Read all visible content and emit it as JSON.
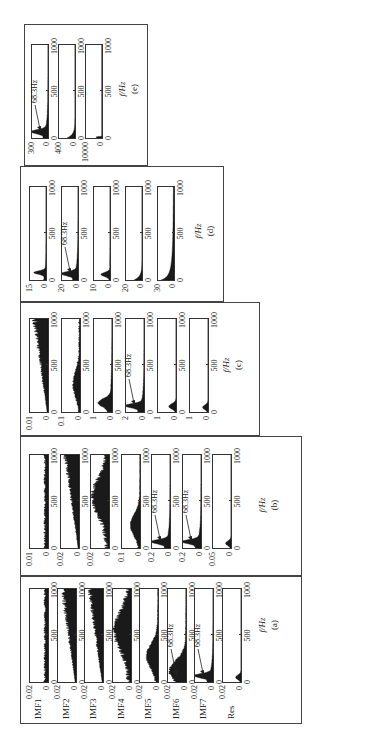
{
  "figure": {
    "orientation": "rotated 90 degrees counter-clockwise on page",
    "x_axis_label": "f/Hz",
    "x_ticks": [
      "0",
      "500",
      "1000"
    ],
    "annotation_text": "68.3Hz"
  },
  "chart_data": [
    {
      "type": "area",
      "panel": "(a)",
      "xlabel": "f/Hz",
      "xlim": [
        0,
        1000
      ],
      "x_ticks": [
        0,
        500,
        1000
      ],
      "subplots": [
        {
          "name": "IMF1",
          "ylim": [
            0,
            0.02
          ],
          "y_ticks": [
            "0",
            "0.02"
          ],
          "shape": "flat broadband noise across 0-1000 Hz"
        },
        {
          "name": "IMF2",
          "ylim": [
            0,
            0.02
          ],
          "y_ticks": [
            "0",
            "0.02"
          ],
          "shape": "low broadband noise rising toward 1000 Hz"
        },
        {
          "name": "IMF3",
          "ylim": [
            0,
            0.02
          ],
          "y_ticks": [
            "0",
            "0.02"
          ],
          "shape": "broadband, increasing toward 1000 Hz"
        },
        {
          "name": "IMF4",
          "ylim": [
            0,
            0.02
          ],
          "y_ticks": [
            "0",
            "0.02"
          ],
          "shape": "broad hump centered ~500-600 Hz"
        },
        {
          "name": "IMF5",
          "ylim": [
            0,
            0.02
          ],
          "y_ticks": [
            "0",
            "0.02"
          ],
          "shape": "hump centered ~250-300 Hz"
        },
        {
          "name": "IMF6",
          "ylim": [
            0,
            0.02
          ],
          "y_ticks": [
            "0",
            "0.02"
          ],
          "shape": "energy below ~400 Hz, peak near 68.3 Hz",
          "annotation": "68.3Hz"
        },
        {
          "name": "IMF7",
          "ylim": [
            0,
            0.02
          ],
          "y_ticks": [
            "0",
            "0.02"
          ],
          "shape": "narrow low-frequency peak at 68.3 Hz",
          "annotation": "68.3Hz"
        },
        {
          "name": "Res",
          "ylim": [
            0,
            0.02
          ],
          "y_ticks": [
            "0",
            "0.02"
          ],
          "shape": "small peak below ~100 Hz"
        }
      ]
    },
    {
      "type": "area",
      "panel": "(b)",
      "xlabel": "f/Hz",
      "xlim": [
        0,
        1000
      ],
      "x_ticks": [
        0,
        500,
        1000
      ],
      "subplots": [
        {
          "ylim": [
            0,
            0.01
          ],
          "y_ticks": [
            "0",
            "0.01"
          ],
          "shape": "flat broadband noise"
        },
        {
          "ylim": [
            0,
            0.02
          ],
          "y_ticks": [
            "0",
            "0.02"
          ],
          "shape": "broadband, rising toward 1000 Hz"
        },
        {
          "ylim": [
            0,
            0.02
          ],
          "y_ticks": [
            "0",
            "0.02"
          ],
          "shape": "broad hump centered ~500 Hz"
        },
        {
          "ylim": [
            0,
            0.1
          ],
          "y_ticks": [
            "0",
            "0.1"
          ],
          "shape": "hump centered ~250 Hz"
        },
        {
          "ylim": [
            0,
            0.2
          ],
          "y_ticks": [
            "0",
            "0.2"
          ],
          "shape": "peak near 68.3 Hz",
          "annotation": "68.3Hz"
        },
        {
          "ylim": [
            0,
            0.2
          ],
          "y_ticks": [
            "0",
            "0.2"
          ],
          "shape": "peak near 68.3 Hz",
          "annotation": "68.3Hz"
        },
        {
          "ylim": [
            0,
            0.05
          ],
          "y_ticks": [
            "0",
            "0.05"
          ],
          "shape": "small peak below ~60 Hz"
        }
      ]
    },
    {
      "type": "area",
      "panel": "(c)",
      "xlabel": "f/Hz",
      "xlim": [
        0,
        1000
      ],
      "x_ticks": [
        0,
        500,
        1000
      ],
      "subplots": [
        {
          "ylim": [
            0,
            0.01
          ],
          "y_ticks": [
            "0",
            "0.01"
          ],
          "shape": "broadband rising toward 1000 Hz"
        },
        {
          "ylim": [
            0,
            0.1
          ],
          "y_ticks": [
            "0",
            "0.1"
          ],
          "shape": "broad hump ~250-400 Hz"
        },
        {
          "ylim": [
            0,
            1
          ],
          "y_ticks": [
            "0",
            "1"
          ],
          "shape": "peak near ~100 Hz decaying"
        },
        {
          "ylim": [
            0,
            2
          ],
          "y_ticks": [
            "0",
            "2"
          ],
          "shape": "peak at 68.3 Hz",
          "annotation": "68.3Hz"
        },
        {
          "ylim": [
            0,
            1
          ],
          "y_ticks": [
            "0",
            "1"
          ],
          "shape": "small low-frequency peak"
        },
        {
          "ylim": [
            0,
            1
          ],
          "y_ticks": [
            "0",
            "1"
          ],
          "shape": "very small low-frequency peak"
        }
      ]
    },
    {
      "type": "area",
      "panel": "(d)",
      "xlabel": "f/Hz",
      "xlim": [
        0,
        1000
      ],
      "x_ticks": [
        0,
        500,
        1000
      ],
      "subplots": [
        {
          "ylim": [
            0,
            15
          ],
          "y_ticks": [
            "0",
            "15"
          ],
          "shape": "sharp peak ~80 Hz"
        },
        {
          "ylim": [
            0,
            20
          ],
          "y_ticks": [
            "0",
            "20"
          ],
          "shape": "sharp peak at 68.3 Hz",
          "annotation": "68.3Hz"
        },
        {
          "ylim": [
            0,
            10
          ],
          "y_ticks": [
            "0",
            "10"
          ],
          "shape": "peak ~60 Hz"
        },
        {
          "ylim": [
            0,
            20
          ],
          "y_ticks": [
            "0",
            "20"
          ],
          "shape": "decaying from 0 Hz"
        },
        {
          "ylim": [
            0,
            30
          ],
          "y_ticks": [
            "0",
            "30"
          ],
          "shape": "1/f-like decay from 0 Hz"
        }
      ]
    },
    {
      "type": "area",
      "panel": "(e)",
      "xlabel": "f/Hz",
      "xlim": [
        0,
        1000
      ],
      "x_ticks": [
        0,
        500,
        1000
      ],
      "subplots": [
        {
          "ylim": [
            0,
            300
          ],
          "y_ticks": [
            "0",
            "300"
          ],
          "shape": "sharp peak at 68.3 Hz",
          "annotation": "68.3Hz"
        },
        {
          "ylim": [
            0,
            400
          ],
          "y_ticks": [
            "0",
            "400"
          ],
          "shape": "decay from 0 Hz"
        },
        {
          "ylim": [
            0,
            10000
          ],
          "y_ticks": [
            "0",
            "10000"
          ],
          "shape": "spike at ~0 Hz only"
        }
      ]
    }
  ],
  "panels": {
    "a": {
      "label": "(a)",
      "xlabel": "f/Hz",
      "rows": [
        {
          "name": "IMF1",
          "ymax": "0.02",
          "ymin": "0",
          "x0": "0",
          "x1": "500",
          "x2": "1000"
        },
        {
          "name": "IMF2",
          "ymax": "0.02",
          "ymin": "0",
          "x0": "0",
          "x1": "500",
          "x2": "1000"
        },
        {
          "name": "IMF3",
          "ymax": "0.02",
          "ymin": "0",
          "x0": "0",
          "x1": "500",
          "x2": "1000"
        },
        {
          "name": "IMF4",
          "ymax": "0.02",
          "ymin": "0",
          "x0": "0",
          "x1": "500",
          "x2": "1000"
        },
        {
          "name": "IMF5",
          "ymax": "0.02",
          "ymin": "0",
          "x0": "0",
          "x1": "500",
          "x2": "1000"
        },
        {
          "name": "IMF6",
          "ymax": "0.02",
          "ymin": "0",
          "x0": "0",
          "x1": "500",
          "x2": "1000",
          "ann": "68.3Hz"
        },
        {
          "name": "IMF7",
          "ymax": "0.02",
          "ymin": "0",
          "x0": "0",
          "x1": "500",
          "x2": "1000",
          "ann": "68.3Hz"
        },
        {
          "name": "Res",
          "ymax": "0.02",
          "ymin": "0",
          "x0": "0",
          "x1": "500",
          "x2": "1000"
        }
      ]
    },
    "b": {
      "label": "(b)",
      "xlabel": "f/Hz",
      "rows": [
        {
          "ymax": "0.01",
          "ymin": "0",
          "x0": "0",
          "x1": "500",
          "x2": "1000"
        },
        {
          "ymax": "0.02",
          "ymin": "0",
          "x0": "0",
          "x1": "500",
          "x2": "1000"
        },
        {
          "ymax": "0.02",
          "ymin": "0",
          "x0": "0",
          "x1": "500",
          "x2": "1000"
        },
        {
          "ymax": "0.1",
          "ymin": "0",
          "x0": "0",
          "x1": "500",
          "x2": "1000"
        },
        {
          "ymax": "0.2",
          "ymin": "0",
          "x0": "0",
          "x1": "500",
          "x2": "1000",
          "ann": "68.3Hz"
        },
        {
          "ymax": "0.2",
          "ymin": "0",
          "x0": "0",
          "x1": "500",
          "x2": "1000",
          "ann": "68.3Hz"
        },
        {
          "ymax": "0.05",
          "ymin": "0",
          "x0": "0",
          "x1": "500",
          "x2": "1000"
        }
      ]
    },
    "c": {
      "label": "(c)",
      "xlabel": "f/Hz",
      "rows": [
        {
          "ymax": "0.01",
          "ymin": "0",
          "x0": "0",
          "x1": "500",
          "x2": "1000"
        },
        {
          "ymax": "0.1",
          "ymin": "0",
          "x0": "0",
          "x1": "500",
          "x2": "1000"
        },
        {
          "ymax": "1",
          "ymin": "0",
          "x0": "0",
          "x1": "500",
          "x2": "1000"
        },
        {
          "ymax": "2",
          "ymin": "0",
          "x0": "0",
          "x1": "500",
          "x2": "1000",
          "ann": "68.3Hz"
        },
        {
          "ymax": "1",
          "ymin": "0",
          "x0": "0",
          "x1": "500",
          "x2": "1000"
        },
        {
          "ymax": "1",
          "ymin": "0",
          "x0": "0",
          "x1": "500",
          "x2": "1000"
        }
      ]
    },
    "d": {
      "label": "(d)",
      "xlabel": "f/Hz",
      "rows": [
        {
          "ymax": "15",
          "ymin": "0",
          "x0": "0",
          "x1": "500",
          "x2": "1000"
        },
        {
          "ymax": "20",
          "ymin": "0",
          "x0": "0",
          "x1": "500",
          "x2": "1000",
          "ann": "68.3Hz"
        },
        {
          "ymax": "10",
          "ymin": "0",
          "x0": "0",
          "x1": "500",
          "x2": "1000"
        },
        {
          "ymax": "20",
          "ymin": "0",
          "x0": "0",
          "x1": "500",
          "x2": "1000"
        },
        {
          "ymax": "30",
          "ymin": "0",
          "x0": "0",
          "x1": "500",
          "x2": "1000"
        }
      ]
    },
    "e": {
      "label": "(e)",
      "xlabel": "f/Hz",
      "rows": [
        {
          "ymax": "300",
          "ymin": "0",
          "x0": "0",
          "x1": "500",
          "x2": "1000",
          "ann": "68.3Hz"
        },
        {
          "ymax": "400",
          "ymin": "0",
          "x0": "0",
          "x1": "500",
          "x2": "1000"
        },
        {
          "ymax": "10000",
          "ymin": "0",
          "x0": "0",
          "x1": "500",
          "x2": "1000"
        }
      ]
    }
  }
}
